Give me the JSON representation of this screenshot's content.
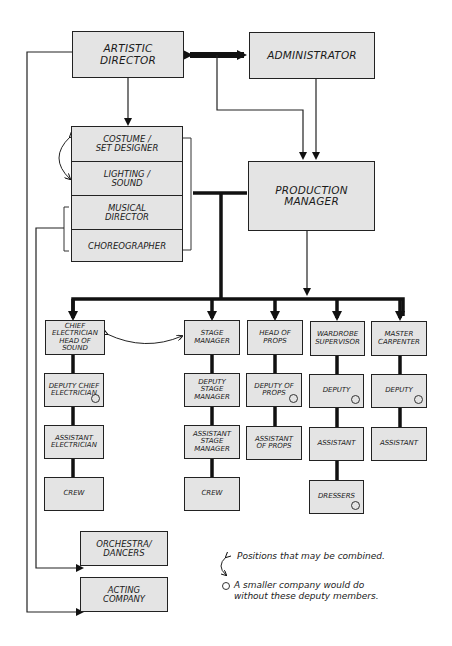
{
  "diagram": {
    "type": "organizational-chart",
    "top": {
      "artistic_director": "ARTISTIC\nDIRECTOR",
      "administrator": "ADMINISTRATOR",
      "production_manager": "PRODUCTION\nMANAGER"
    },
    "creative_stack": [
      {
        "label": "COSTUME /\nSET DESIGNER"
      },
      {
        "label": "LIGHTING /\nSOUND"
      },
      {
        "label": "MUSICAL\nDIRECTOR"
      },
      {
        "label": "CHOREOGRAPHER"
      }
    ],
    "departments": [
      {
        "head": "CHIEF\nELECTRICIAN\nHEAD of SOUND",
        "chain": [
          {
            "label": "DEPUTY CHIEF\nELECTRICIAN",
            "optional": true
          },
          {
            "label": "ASSISTANT\nELECTRICIAN",
            "optional": false
          },
          {
            "label": "CREW",
            "optional": false
          }
        ]
      },
      {
        "head": "STAGE\nMANAGER",
        "chain": [
          {
            "label": "DEPUTY\nSTAGE\nMANAGER",
            "optional": false
          },
          {
            "label": "ASSISTANT\nSTAGE\nMANAGER",
            "optional": false
          },
          {
            "label": "CREW",
            "optional": false
          }
        ]
      },
      {
        "head": "HEAD OF\nPROPS",
        "chain": [
          {
            "label": "DEPUTY OF\nPROPS",
            "optional": true
          },
          {
            "label": "ASSISTANT\nOF PROPS",
            "optional": false
          }
        ]
      },
      {
        "head": "WARDROBE\nSUPERVISOR",
        "chain": [
          {
            "label": "DEPUTY",
            "optional": true
          },
          {
            "label": "ASSISTANT",
            "optional": false
          },
          {
            "label": "DRESSERS",
            "optional": true
          }
        ]
      },
      {
        "head": "MASTER\nCARPENTER",
        "chain": [
          {
            "label": "DEPUTY",
            "optional": true
          },
          {
            "label": "ASSISTANT",
            "optional": false
          }
        ]
      }
    ],
    "performers": {
      "orchestra": "ORCHESTRA/\nDANCERS",
      "acting": "ACTING\nCOMPANY"
    },
    "legend": {
      "combined": "Positions that may be combined.",
      "optional": "A smaller company would do\nwithout these deputy members."
    },
    "colors": {
      "box_fill": "#e4e4e4",
      "line": "#111111",
      "background": "#ffffff"
    }
  }
}
